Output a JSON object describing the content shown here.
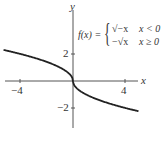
{
  "chart_data": {
    "type": "line",
    "title": "",
    "xlabel": "x",
    "ylabel": "y",
    "xlim": [
      -5.3,
      5
    ],
    "ylim": [
      -3.2,
      5.6
    ],
    "xticks": [
      -4,
      4
    ],
    "yticks": [
      2,
      -2
    ],
    "grid": false,
    "legend": null,
    "annotation": "f(x) = { √(−x), x < 0 ; −√x, x ≥ 0 }",
    "series": [
      {
        "name": "f(x)",
        "x": [
          -5.3,
          -4,
          -3,
          -2,
          -1,
          -0.5,
          -0.1,
          0,
          0.1,
          0.5,
          1,
          2,
          3,
          4,
          5
        ],
        "y": [
          2.3,
          2,
          1.73,
          1.41,
          1,
          0.71,
          0.32,
          0,
          -0.32,
          -0.71,
          -1,
          -1.41,
          -1.73,
          -2,
          -2.24
        ]
      }
    ]
  },
  "labels": {
    "x_axis": "x",
    "y_axis": "y",
    "xtick_neg4": "−4",
    "xtick_4": "4",
    "ytick_2": "2",
    "ytick_neg2": "−2",
    "formula_lhs": "f(x) =",
    "case1_expr": "√−x",
    "case1_cond": "x < 0",
    "case2_expr": "−√x",
    "case2_cond": "x ≥ 0"
  }
}
